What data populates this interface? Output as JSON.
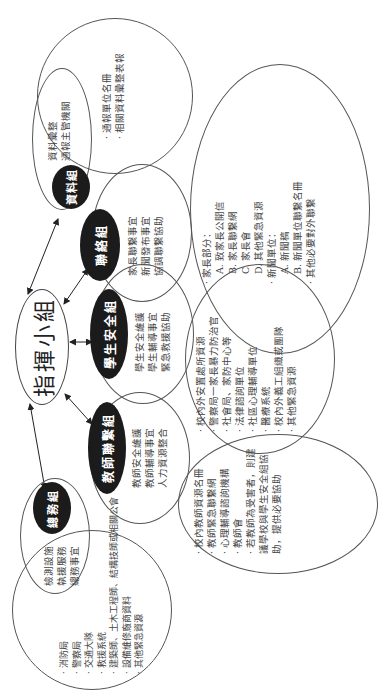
{
  "diagram": {
    "orientation": "rotated -90deg (text reads bottom-to-top)",
    "center": {
      "label": "指揮小組"
    },
    "groups": [
      {
        "id": "data",
        "label": "資料組",
        "duties": [
          "資料彙整",
          "通報主管機關"
        ],
        "details": [
          "通報單位名冊",
          "相關資料彙整表報"
        ]
      },
      {
        "id": "liaison",
        "label": "聯絡組",
        "duties": [
          "家長聯繫事宜",
          "新聞發布事宜",
          "協調聯繫協助"
        ],
        "details": [
          {
            "text": "家長部分：",
            "bullet": true
          },
          {
            "text": "A. 致家長公開信",
            "bullet": false
          },
          {
            "text": "B. 家長聯繫網",
            "bullet": false
          },
          {
            "text": "C. 家長會",
            "bullet": false
          },
          {
            "text": "D. 其他緊急資源",
            "bullet": false
          },
          {
            "text": "新聞單位：",
            "bullet": true
          },
          {
            "text": "A. 新聞稿",
            "bullet": false
          },
          {
            "text": "B. 新聞單位聯繫名冊",
            "bullet": false
          },
          {
            "text": "其他必要對外聯繫",
            "bullet": true
          }
        ]
      },
      {
        "id": "student-safety",
        "label": "學生安全組",
        "duties": [
          "學生安全維護",
          "學生輔導事宜",
          "緊急救援協助"
        ],
        "details": [
          "校內外安置處所資源",
          "警察局一家長暴力防治官",
          "社會局、家防中心等",
          "法律諮詢單位",
          "社區心理輔導單位",
          "醫療系統",
          "校內外義工組織或團隊",
          "其他緊急資源"
        ]
      },
      {
        "id": "teacher-liaison",
        "label": "教師聯繫組",
        "duties": [
          "教師安全維護",
          "教師輔導事宜",
          "人力資源整合"
        ],
        "details": [
          "校內教師資源名冊",
          "教師緊急聯繫網",
          "心理輔導諮詢機構",
          "教師會",
          "若教師為受害者，則建議學校與學生安全組協助，提供必要協助"
        ]
      },
      {
        "id": "general-affairs",
        "label": "總務組",
        "duties": [
          "檢測設施",
          "執援服務",
          "總務事宜"
        ],
        "details": [
          "消防局",
          "警察局",
          "交通大隊",
          "救援系統",
          "建築師、土木工程師、結構技師或相關公會",
          "設備維修廠商資料",
          "其他緊急資源"
        ]
      }
    ],
    "connections": [
      {
        "from": "指揮小組",
        "to": "資料組",
        "type": "bidirectional-arrow"
      },
      {
        "from": "指揮小組",
        "to": "聯絡組",
        "type": "bidirectional-arrow"
      },
      {
        "from": "指揮小組",
        "to": "學生安全組",
        "type": "bidirectional-arrow"
      },
      {
        "from": "指揮小組",
        "to": "教師聯繫組",
        "type": "bidirectional-arrow"
      },
      {
        "from": "指揮小組",
        "to": "總務組",
        "type": "bidirectional-arrow"
      }
    ]
  },
  "colors": {
    "node_fill": "#1b1b1b",
    "node_text": "#ffffff",
    "outline": "#555555",
    "text": "#444444",
    "background": "#ffffff"
  }
}
